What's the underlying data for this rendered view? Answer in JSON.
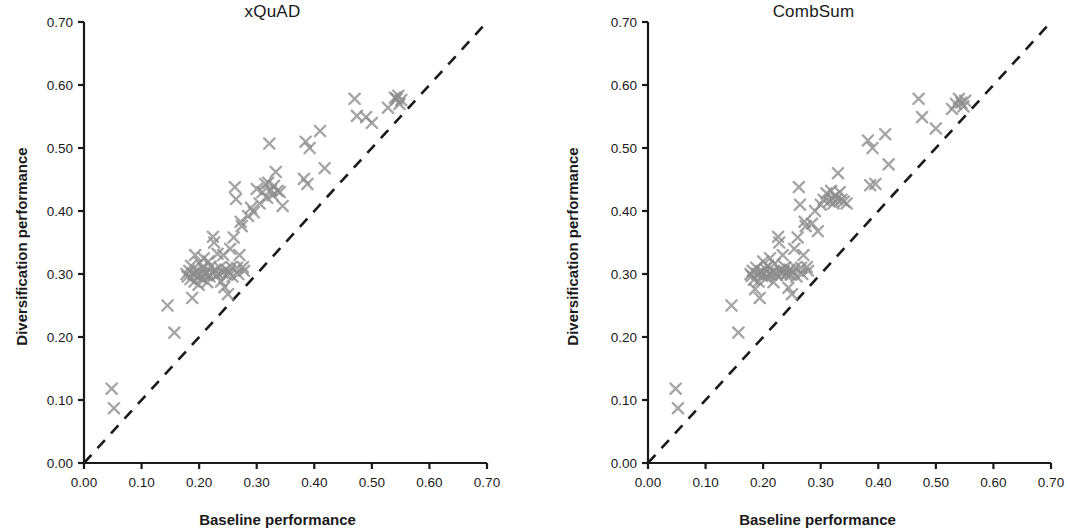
{
  "figure": {
    "width": 1070,
    "height": 530,
    "background": "#ffffff",
    "marker_color": "#8c8c8c",
    "axis_color": "#1a1a1a",
    "diagonal_color": "#1a1a1a"
  },
  "axis_label_x": "Baseline performance",
  "axis_label_y": "Diversification performance",
  "chart_data": [
    {
      "type": "scatter",
      "title": "xQuAD",
      "xlabel": "Baseline performance",
      "ylabel": "Diversification performance",
      "xlim": [
        0.0,
        0.7
      ],
      "ylim": [
        0.0,
        0.7
      ],
      "xticks": [
        "0.00",
        "0.10",
        "0.20",
        "0.30",
        "0.40",
        "0.50",
        "0.60",
        "0.70"
      ],
      "yticks": [
        "0.00",
        "0.10",
        "0.20",
        "0.30",
        "0.40",
        "0.50",
        "0.60",
        "0.70"
      ],
      "xtick_values": [
        0.0,
        0.1,
        0.2,
        0.3,
        0.4,
        0.5,
        0.6,
        0.7
      ],
      "ytick_values": [
        0.0,
        0.1,
        0.2,
        0.3,
        0.4,
        0.5,
        0.6,
        0.7
      ],
      "grid": false,
      "legend": null,
      "marker": "x",
      "marker_color": "#8c8c8c",
      "annotations": [
        {
          "kind": "reference-line",
          "label": "y = x diagonal",
          "style": "dashed",
          "from": [
            0.0,
            0.0
          ],
          "to": [
            0.7,
            0.7
          ]
        }
      ],
      "points": [
        [
          0.048,
          0.118
        ],
        [
          0.052,
          0.087
        ],
        [
          0.145,
          0.25
        ],
        [
          0.157,
          0.207
        ],
        [
          0.178,
          0.3
        ],
        [
          0.18,
          0.296
        ],
        [
          0.183,
          0.305
        ],
        [
          0.185,
          0.292
        ],
        [
          0.186,
          0.313
        ],
        [
          0.188,
          0.262
        ],
        [
          0.19,
          0.3
        ],
        [
          0.192,
          0.288
        ],
        [
          0.193,
          0.33
        ],
        [
          0.195,
          0.305
        ],
        [
          0.197,
          0.297
        ],
        [
          0.199,
          0.283
        ],
        [
          0.201,
          0.318
        ],
        [
          0.203,
          0.3
        ],
        [
          0.205,
          0.293
        ],
        [
          0.207,
          0.309
        ],
        [
          0.208,
          0.325
        ],
        [
          0.21,
          0.299
        ],
        [
          0.212,
          0.301
        ],
        [
          0.214,
          0.287
        ],
        [
          0.216,
          0.32
        ],
        [
          0.218,
          0.296
        ],
        [
          0.22,
          0.312
        ],
        [
          0.222,
          0.302
        ],
        [
          0.224,
          0.359
        ],
        [
          0.226,
          0.35
        ],
        [
          0.228,
          0.306
        ],
        [
          0.23,
          0.298
        ],
        [
          0.232,
          0.332
        ],
        [
          0.234,
          0.3
        ],
        [
          0.236,
          0.31
        ],
        [
          0.238,
          0.288
        ],
        [
          0.24,
          0.302
        ],
        [
          0.242,
          0.33
        ],
        [
          0.244,
          0.279
        ],
        [
          0.246,
          0.307
        ],
        [
          0.248,
          0.299
        ],
        [
          0.25,
          0.268
        ],
        [
          0.252,
          0.303
        ],
        [
          0.254,
          0.34
        ],
        [
          0.256,
          0.311
        ],
        [
          0.258,
          0.296
        ],
        [
          0.26,
          0.358
        ],
        [
          0.262,
          0.438
        ],
        [
          0.264,
          0.419
        ],
        [
          0.266,
          0.31
        ],
        [
          0.268,
          0.3
        ],
        [
          0.27,
          0.33
        ],
        [
          0.272,
          0.383
        ],
        [
          0.274,
          0.376
        ],
        [
          0.276,
          0.311
        ],
        [
          0.278,
          0.305
        ],
        [
          0.285,
          0.392
        ],
        [
          0.29,
          0.405
        ],
        [
          0.295,
          0.398
        ],
        [
          0.3,
          0.435
        ],
        [
          0.305,
          0.412
        ],
        [
          0.31,
          0.43
        ],
        [
          0.315,
          0.443
        ],
        [
          0.318,
          0.421
        ],
        [
          0.32,
          0.445
        ],
        [
          0.322,
          0.507
        ],
        [
          0.325,
          0.433
        ],
        [
          0.328,
          0.425
        ],
        [
          0.33,
          0.44
        ],
        [
          0.333,
          0.462
        ],
        [
          0.336,
          0.432
        ],
        [
          0.34,
          0.43
        ],
        [
          0.345,
          0.408
        ],
        [
          0.382,
          0.451
        ],
        [
          0.385,
          0.51
        ],
        [
          0.388,
          0.443
        ],
        [
          0.392,
          0.5
        ],
        [
          0.41,
          0.527
        ],
        [
          0.418,
          0.468
        ],
        [
          0.47,
          0.578
        ],
        [
          0.474,
          0.551
        ],
        [
          0.49,
          0.549
        ],
        [
          0.5,
          0.54
        ],
        [
          0.528,
          0.564
        ],
        [
          0.54,
          0.58
        ],
        [
          0.543,
          0.578
        ],
        [
          0.546,
          0.583
        ],
        [
          0.548,
          0.57
        ],
        [
          0.551,
          0.576
        ]
      ]
    },
    {
      "type": "scatter",
      "title": "CombSum",
      "xlabel": "Baseline performance",
      "ylabel": "Diversification performance",
      "xlim": [
        0.0,
        0.7
      ],
      "ylim": [
        0.0,
        0.7
      ],
      "xticks": [
        "0.00",
        "0.10",
        "0.20",
        "0.30",
        "0.40",
        "0.50",
        "0.60",
        "0.70"
      ],
      "yticks": [
        "0.00",
        "0.10",
        "0.20",
        "0.30",
        "0.40",
        "0.50",
        "0.60",
        "0.70"
      ],
      "xtick_values": [
        0.0,
        0.1,
        0.2,
        0.3,
        0.4,
        0.5,
        0.6,
        0.7
      ],
      "ytick_values": [
        0.0,
        0.1,
        0.2,
        0.3,
        0.4,
        0.5,
        0.6,
        0.7
      ],
      "grid": false,
      "legend": null,
      "marker": "x",
      "marker_color": "#8c8c8c",
      "annotations": [
        {
          "kind": "reference-line",
          "label": "y = x diagonal",
          "style": "dashed",
          "from": [
            0.0,
            0.0
          ],
          "to": [
            0.7,
            0.7
          ]
        }
      ],
      "points": [
        [
          0.048,
          0.118
        ],
        [
          0.052,
          0.087
        ],
        [
          0.145,
          0.25
        ],
        [
          0.157,
          0.207
        ],
        [
          0.178,
          0.3
        ],
        [
          0.18,
          0.297
        ],
        [
          0.182,
          0.305
        ],
        [
          0.184,
          0.291
        ],
        [
          0.186,
          0.276
        ],
        [
          0.188,
          0.31
        ],
        [
          0.19,
          0.3
        ],
        [
          0.192,
          0.288
        ],
        [
          0.194,
          0.262
        ],
        [
          0.196,
          0.304
        ],
        [
          0.198,
          0.297
        ],
        [
          0.2,
          0.32
        ],
        [
          0.202,
          0.301
        ],
        [
          0.204,
          0.308
        ],
        [
          0.206,
          0.294
        ],
        [
          0.208,
          0.313
        ],
        [
          0.21,
          0.3
        ],
        [
          0.212,
          0.325
        ],
        [
          0.214,
          0.299
        ],
        [
          0.216,
          0.304
        ],
        [
          0.218,
          0.287
        ],
        [
          0.22,
          0.316
        ],
        [
          0.222,
          0.302
        ],
        [
          0.224,
          0.298
        ],
        [
          0.226,
          0.359
        ],
        [
          0.228,
          0.35
        ],
        [
          0.23,
          0.306
        ],
        [
          0.232,
          0.3
        ],
        [
          0.234,
          0.33
        ],
        [
          0.236,
          0.305
        ],
        [
          0.238,
          0.311
        ],
        [
          0.24,
          0.299
        ],
        [
          0.242,
          0.302
        ],
        [
          0.244,
          0.278
        ],
        [
          0.246,
          0.307
        ],
        [
          0.248,
          0.299
        ],
        [
          0.25,
          0.268
        ],
        [
          0.252,
          0.303
        ],
        [
          0.254,
          0.34
        ],
        [
          0.256,
          0.31
        ],
        [
          0.258,
          0.296
        ],
        [
          0.26,
          0.358
        ],
        [
          0.262,
          0.438
        ],
        [
          0.264,
          0.41
        ],
        [
          0.266,
          0.31
        ],
        [
          0.268,
          0.3
        ],
        [
          0.27,
          0.33
        ],
        [
          0.272,
          0.383
        ],
        [
          0.274,
          0.376
        ],
        [
          0.276,
          0.311
        ],
        [
          0.278,
          0.305
        ],
        [
          0.285,
          0.38
        ],
        [
          0.29,
          0.4
        ],
        [
          0.295,
          0.368
        ],
        [
          0.3,
          0.41
        ],
        [
          0.305,
          0.418
        ],
        [
          0.31,
          0.428
        ],
        [
          0.315,
          0.415
        ],
        [
          0.318,
          0.432
        ],
        [
          0.32,
          0.42
        ],
        [
          0.322,
          0.412
        ],
        [
          0.325,
          0.424
        ],
        [
          0.328,
          0.419
        ],
        [
          0.33,
          0.46
        ],
        [
          0.333,
          0.43
        ],
        [
          0.336,
          0.418
        ],
        [
          0.34,
          0.415
        ],
        [
          0.345,
          0.412
        ],
        [
          0.382,
          0.512
        ],
        [
          0.386,
          0.441
        ],
        [
          0.39,
          0.5
        ],
        [
          0.395,
          0.443
        ],
        [
          0.412,
          0.522
        ],
        [
          0.418,
          0.474
        ],
        [
          0.47,
          0.578
        ],
        [
          0.476,
          0.549
        ],
        [
          0.5,
          0.531
        ],
        [
          0.528,
          0.562
        ],
        [
          0.535,
          0.57
        ],
        [
          0.54,
          0.578
        ],
        [
          0.544,
          0.572
        ],
        [
          0.548,
          0.566
        ],
        [
          0.551,
          0.575
        ]
      ]
    }
  ]
}
